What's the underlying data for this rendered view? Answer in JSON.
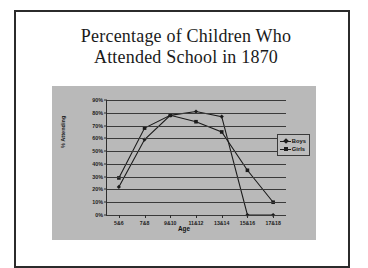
{
  "slide": {
    "title_line1": "Percentage of Children Who",
    "title_line2": "Attended School in 1870"
  },
  "chart_data": {
    "type": "line",
    "title": "Percentage of Children Who Attended School in 1870",
    "xlabel": "Age",
    "ylabel": "% Attending",
    "categories": [
      "5&6",
      "7&8",
      "9&10",
      "11&12",
      "13&14",
      "15&16",
      "17&18"
    ],
    "series": [
      {
        "name": "Boys",
        "marker": "diamond",
        "color": "#1b1b1b",
        "values": [
          22,
          59,
          78,
          81,
          77,
          0,
          0
        ]
      },
      {
        "name": "Girls",
        "marker": "square",
        "color": "#1b1b1b",
        "values": [
          29,
          68,
          78,
          73,
          65,
          35,
          10
        ]
      }
    ],
    "ylim": [
      0,
      90
    ],
    "ytick_labels": [
      "90%",
      "80%",
      "70%",
      "60%",
      "50%",
      "40%",
      "30%",
      "20%",
      "10%",
      "0%"
    ],
    "ytick_values": [
      90,
      80,
      70,
      60,
      50,
      40,
      30,
      20,
      10,
      0
    ],
    "grid": true,
    "legend_position": "right",
    "plot_background": "#b9b9b9"
  }
}
